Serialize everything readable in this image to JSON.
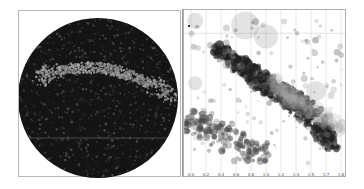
{
  "chart_data": [
    {
      "type": "scatter",
      "title": "",
      "subtitle": "All-sky projection (disc) of source density",
      "description": "Circular all-sky map rendered as a dark disc densely filled with points; a lighter grey arc-shaped band (the galactic plane) crosses the upper-middle of the disc.",
      "xlabel": "",
      "ylabel": "",
      "grid": false,
      "legend": null,
      "disc": {
        "cx": 97,
        "cy": 97,
        "r": 80,
        "fill": "#141414"
      },
      "band": {
        "color": "#9a9a9a",
        "shape": "arc",
        "from": [
          35,
          78
        ],
        "peak": [
          100,
          62
        ],
        "to": [
          172,
          96
        ]
      },
      "annotations": [
        {
          "type": "hline",
          "y_px": 137,
          "color": "#6b6b6b"
        }
      ]
    },
    {
      "type": "scatter",
      "title": "",
      "xlabel": "",
      "ylabel": "",
      "grid": true,
      "legend": null,
      "x_tick_labels": [
        "0.0",
        "0.2",
        "0.4",
        "0.6",
        "0.8",
        "1.0",
        "1.2",
        "1.4",
        "1.5",
        "1.7",
        "1.8"
      ],
      "xlim": [
        0.0,
        1.8
      ],
      "marker": "semi-transparent grey circles of varying size",
      "series": [
        {
          "name": "main-sequence band",
          "description": "Dense dark diagonal band running from upper-left (x≈0.2, high) to lower-right (x≈1.8, low)",
          "points": [
            {
              "x": 0.3,
              "y": 0.78,
              "r": 4
            },
            {
              "x": 0.45,
              "y": 0.72,
              "r": 5
            },
            {
              "x": 0.6,
              "y": 0.66,
              "r": 5
            },
            {
              "x": 0.75,
              "y": 0.6,
              "r": 6
            },
            {
              "x": 0.9,
              "y": 0.55,
              "r": 6
            },
            {
              "x": 1.05,
              "y": 0.5,
              "r": 6
            },
            {
              "x": 1.2,
              "y": 0.45,
              "r": 6
            },
            {
              "x": 1.35,
              "y": 0.38,
              "r": 7
            },
            {
              "x": 1.5,
              "y": 0.3,
              "r": 7
            },
            {
              "x": 1.6,
              "y": 0.22,
              "r": 6
            },
            {
              "x": 1.72,
              "y": 0.15,
              "r": 5
            }
          ]
        },
        {
          "name": "lower cluster",
          "description": "Secondary sparser clump of mid-grey circles in lower-left",
          "points": [
            {
              "x": 0.05,
              "y": 0.3,
              "r": 3
            },
            {
              "x": 0.2,
              "y": 0.26,
              "r": 4
            },
            {
              "x": 0.35,
              "y": 0.22,
              "r": 4
            },
            {
              "x": 0.5,
              "y": 0.18,
              "r": 4
            },
            {
              "x": 0.65,
              "y": 0.12,
              "r": 3
            },
            {
              "x": 0.8,
              "y": 0.1,
              "r": 3
            }
          ]
        },
        {
          "name": "large faint markers",
          "description": "Few very large pale circles near the top",
          "points": [
            {
              "x": 0.65,
              "y": 0.92,
              "r": 14
            },
            {
              "x": 0.9,
              "y": 0.85,
              "r": 12
            },
            {
              "x": 0.05,
              "y": 0.95,
              "r": 8
            },
            {
              "x": 0.05,
              "y": 0.55,
              "r": 7
            },
            {
              "x": 1.5,
              "y": 0.5,
              "r": 10
            }
          ]
        }
      ],
      "annotations": [
        {
          "type": "hline",
          "y_frac": 0.87,
          "color": "#d0d0d0"
        }
      ]
    }
  ]
}
